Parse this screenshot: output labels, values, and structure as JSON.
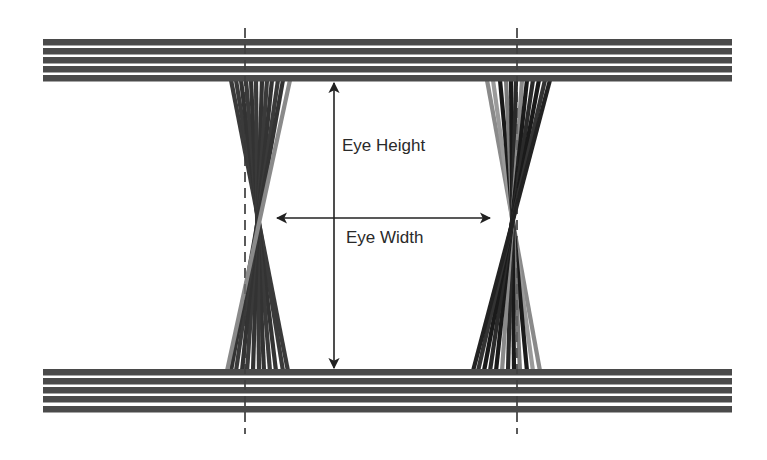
{
  "diagram": {
    "colors": {
      "background": "#ffffff",
      "rail_dark": "#4a4a4a",
      "trace_dark": "#333333",
      "trace_black": "#1a1a1a",
      "trace_gray": "#8a8a8a",
      "arrow": "#222222",
      "dashed_marker": "#333333",
      "text": "#2a2a2a"
    },
    "labels": {
      "eye_height": "Eye Height",
      "eye_width": "Eye Width"
    },
    "rails": {
      "x_start": 43,
      "x_end": 732,
      "top_bands": [
        39,
        48,
        57,
        66,
        75
      ],
      "bottom_bands": [
        369,
        378,
        387,
        396,
        406
      ],
      "band_thickness": 6.5
    },
    "sampling_markers": [
      {
        "name": "left-unit-interval-marker",
        "x": 245,
        "y_top": 28,
        "y_bottom": 434
      },
      {
        "name": "right-unit-interval-marker",
        "x": 517,
        "y_top": 28,
        "y_bottom": 434
      }
    ],
    "crossings": [
      {
        "name": "left-crossing-bundle",
        "y_top": 82,
        "y_bottom": 369,
        "traces": [
          {
            "x_top": 231,
            "x_bottom": 288,
            "color": "#3a3a3a"
          },
          {
            "x_top": 236,
            "x_bottom": 283,
            "color": "#3a3a3a"
          },
          {
            "x_top": 241,
            "x_bottom": 276,
            "color": "#333333"
          },
          {
            "x_top": 246,
            "x_bottom": 270,
            "color": "#3a3a3a"
          },
          {
            "x_top": 251,
            "x_bottom": 264,
            "color": "#333333"
          },
          {
            "x_top": 256,
            "x_bottom": 259,
            "color": "#3a3a3a"
          },
          {
            "x_top": 262,
            "x_bottom": 253,
            "color": "#333333"
          },
          {
            "x_top": 267,
            "x_bottom": 247,
            "color": "#3a3a3a"
          },
          {
            "x_top": 272,
            "x_bottom": 242,
            "color": "#333333"
          },
          {
            "x_top": 278,
            "x_bottom": 236,
            "color": "#3a3a3a"
          },
          {
            "x_top": 283,
            "x_bottom": 231,
            "color": "#333333"
          },
          {
            "x_top": 290,
            "x_bottom": 227,
            "color": "#8a8a8a"
          }
        ]
      },
      {
        "name": "right-crossing-bundle",
        "y_top": 82,
        "y_bottom": 369,
        "traces": [
          {
            "x_top": 487,
            "x_bottom": 540,
            "color": "#8a8a8a"
          },
          {
            "x_top": 493,
            "x_bottom": 533,
            "color": "#9a9a9a"
          },
          {
            "x_top": 500,
            "x_bottom": 527,
            "color": "#1a1a1a"
          },
          {
            "x_top": 506,
            "x_bottom": 520,
            "color": "#7a7a7a"
          },
          {
            "x_top": 511,
            "x_bottom": 514,
            "color": "#1a1a1a"
          },
          {
            "x_top": 516,
            "x_bottom": 508,
            "color": "#2a2a2a"
          },
          {
            "x_top": 522,
            "x_bottom": 502,
            "color": "#8a8a8a"
          },
          {
            "x_top": 527,
            "x_bottom": 496,
            "color": "#1a1a1a"
          },
          {
            "x_top": 533,
            "x_bottom": 490,
            "color": "#2a2a2a"
          },
          {
            "x_top": 539,
            "x_bottom": 484,
            "color": "#1a1a1a"
          },
          {
            "x_top": 545,
            "x_bottom": 478,
            "color": "#333333"
          },
          {
            "x_top": 550,
            "x_bottom": 473,
            "color": "#222222"
          }
        ]
      }
    ],
    "eye_height_arrow": {
      "x": 334,
      "y_top": 83,
      "y_bottom": 368,
      "label_x": 342,
      "label_y": 151
    },
    "eye_width_arrow": {
      "y": 218,
      "x_left": 277,
      "x_right": 490,
      "label_x": 346,
      "label_y": 243
    }
  }
}
